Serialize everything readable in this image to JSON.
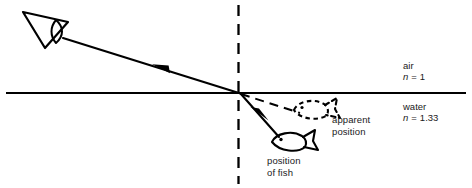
{
  "diagram": {
    "type": "optics-ray-diagram",
    "width": 472,
    "height": 188,
    "colors": {
      "ink": "#000000",
      "background": "#ffffff",
      "text": "#1a1a1a"
    }
  },
  "media": {
    "upper": {
      "name": "air",
      "index_symbol": "n",
      "index_equals": "=",
      "index_value": "1",
      "index_text": "n = 1"
    },
    "lower": {
      "name": "water",
      "index_symbol": "n",
      "index_equals": "=",
      "index_value": "1.33",
      "index_text": "n = 1.33"
    }
  },
  "labels": {
    "apparent_position_line1": "apparent",
    "apparent_position_line2": "position",
    "position_of_fish_line1": "position",
    "position_of_fish_line2": "of fish"
  },
  "elements": {
    "eye": {
      "name": "observer-eye",
      "x": 45,
      "y": 28
    },
    "real_fish": {
      "name": "real-fish",
      "x": 288,
      "y": 142,
      "style": "solid",
      "facing": "left"
    },
    "apparent_fish": {
      "name": "apparent-fish",
      "x": 312,
      "y": 110,
      "style": "dashed",
      "facing": "left"
    },
    "interface": {
      "name": "air-water-interface",
      "y": 93,
      "x_start": 6,
      "x_end": 466,
      "style": "solid"
    },
    "normal": {
      "name": "normal-line",
      "x": 238,
      "y_start": 5,
      "y_end": 184,
      "style": "dashed"
    },
    "refraction_point": {
      "x": 240,
      "y": 93
    }
  },
  "rays": [
    {
      "name": "refracted-ray-to-eye",
      "style": "solid",
      "from": [
        240,
        93
      ],
      "to": [
        63,
        38
      ],
      "arrow_direction": "toward-eye",
      "arrow_at": [
        160,
        67
      ]
    },
    {
      "name": "incident-ray-from-fish",
      "style": "solid",
      "from": [
        278,
        136
      ],
      "to": [
        240,
        93
      ],
      "arrow_direction": "toward-surface",
      "arrow_at": [
        256,
        115
      ]
    },
    {
      "name": "apparent-ray-extension",
      "style": "dashed",
      "from": [
        240,
        93
      ],
      "to": [
        300,
        112
      ],
      "arrow_direction": "none"
    }
  ]
}
